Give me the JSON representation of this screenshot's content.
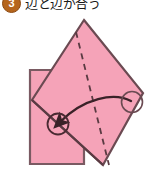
{
  "header": {
    "step_number": "3",
    "instruction": "辺と辺が合う",
    "badge_color": "#b5651d"
  },
  "figure": {
    "name": "origami-fold-diagram",
    "caption": "Square paper rotated over a square outline with a fold crease and a curved motion arrow",
    "colors": {
      "paper_fill": "#f5a3b8",
      "paper_stroke": "#6b4a52",
      "base_square_stroke": "#7a5a62",
      "crease_dash": "#5a3a42",
      "arrow": "#3a2228",
      "marker_circle": "#4a2a32",
      "background": "#ffffff"
    },
    "elements": {
      "base_square_label": "base-square-outline",
      "rotated_square_label": "rotated-paper",
      "crease_label": "fold-crease-dashed",
      "arrow_label": "fold-direction-arrow",
      "left_marker_label": "target-point-left",
      "right_marker_label": "source-point-right"
    },
    "geometry": {
      "base_square": "20,56 74,56 74,150 20,150",
      "rotated_square": "74,6 133,79 93,151 22,86",
      "crease": "66,18 99,151",
      "arrow_path": "M 121,87 C 104,78 74,84 48,110",
      "left_marker": {
        "cx": 48,
        "cy": 110,
        "r": 11
      },
      "right_marker": {
        "cx": 122,
        "cy": 88,
        "r": 11
      }
    }
  }
}
